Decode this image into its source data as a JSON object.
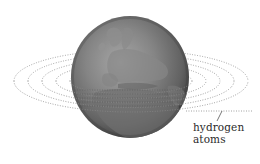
{
  "diagram": {
    "label": {
      "line1": "hydrogen",
      "line2": "atoms"
    },
    "colors": {
      "background": "#ffffff",
      "globe_light": "#9a9a9a",
      "globe_mid": "#7a7a7a",
      "globe_dark": "#4a4a4a",
      "land": "#8c8c8c",
      "ring_dots": "#8a8a8a",
      "text": "#2b2b2b"
    },
    "globe": {
      "cx": 130,
      "cy": 77,
      "rx": 59,
      "ry": 61
    },
    "rings": {
      "count": 5,
      "center": [
        131,
        81
      ],
      "outer_rx": 117,
      "outer_ry": 31,
      "spacing_rx": 14,
      "spacing_ry": 4.5
    },
    "leader_line": {
      "from": [
        222,
        111
      ],
      "to": [
        217,
        121
      ]
    }
  }
}
